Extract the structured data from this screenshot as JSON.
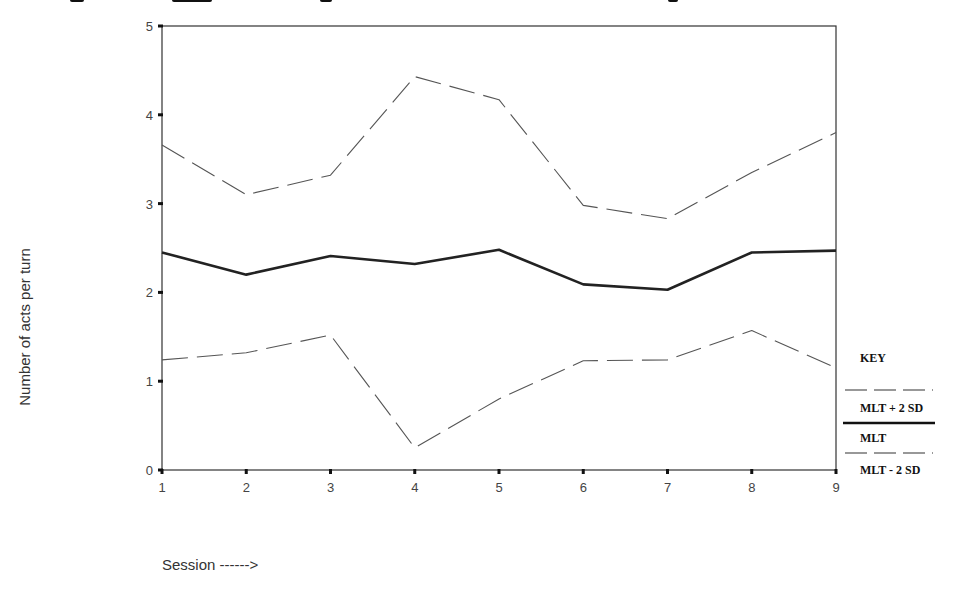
{
  "chart_data": {
    "type": "line",
    "title": "",
    "xlabel": "Session ------>",
    "ylabel": "Number of acts per turn",
    "x": [
      1,
      2,
      3,
      4,
      5,
      6,
      7,
      8,
      9
    ],
    "xlim": [
      1,
      9
    ],
    "ylim": [
      0,
      5
    ],
    "yticks": [
      0,
      1,
      2,
      3,
      4,
      5
    ],
    "xticks": [
      1,
      2,
      3,
      4,
      5,
      6,
      7,
      8,
      9
    ],
    "grid": false,
    "legend_position": "right",
    "legend_title": "KEY",
    "series": [
      {
        "name": "MLT + 2 SD",
        "style": "dashed",
        "values": [
          3.66,
          3.1,
          3.32,
          4.43,
          4.17,
          2.98,
          2.83,
          3.35,
          3.8
        ]
      },
      {
        "name": "MLT",
        "style": "solid-bold",
        "values": [
          2.45,
          2.2,
          2.41,
          2.32,
          2.48,
          2.09,
          2.03,
          2.45,
          2.47
        ]
      },
      {
        "name": "MLT - 2 SD",
        "style": "dashed",
        "values": [
          1.24,
          1.32,
          1.52,
          0.25,
          0.8,
          1.23,
          1.24,
          1.57,
          1.15
        ]
      }
    ]
  },
  "labels": {
    "ylabel": "Number of acts per turn",
    "xlabel": "Session ------>",
    "legend_title": "KEY",
    "legend_upper": "MLT + 2 SD",
    "legend_mid": "MLT",
    "legend_lower": "MLT - 2 SD"
  },
  "colors": {
    "line": "#222222",
    "dashed": "#555555",
    "axis": "#333333"
  }
}
